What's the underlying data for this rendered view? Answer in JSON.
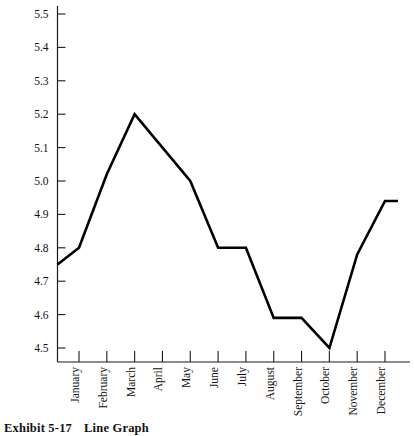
{
  "figure": {
    "caption_label": "Exhibit 5-17",
    "caption_title": "Line Graph"
  },
  "chart_data": {
    "type": "line",
    "title": "",
    "subtitle": "",
    "xlabel": "",
    "ylabel": "",
    "categories": [
      "January",
      "February",
      "March",
      "April",
      "May",
      "June",
      "July",
      "August",
      "September",
      "October",
      "November",
      "December"
    ],
    "values": [
      4.8,
      5.02,
      5.2,
      5.1,
      5.0,
      4.8,
      4.8,
      4.59,
      4.59,
      4.5,
      4.78,
      4.94
    ],
    "series": [
      {
        "name": "series-1",
        "values": [
          4.8,
          5.02,
          5.2,
          5.1,
          5.0,
          4.8,
          4.8,
          4.59,
          4.59,
          4.5,
          4.78,
          4.94
        ]
      }
    ],
    "lead_in_value": 4.75,
    "trail_out_value": 4.94,
    "ylim": [
      4.5,
      5.5
    ],
    "ytick_values": [
      4.5,
      4.6,
      4.7,
      4.8,
      4.9,
      5.0,
      5.1,
      5.2,
      5.3,
      5.4,
      5.5
    ],
    "ytick_labels": [
      "4.5",
      "4.6",
      "4.7",
      "4.8",
      "4.9",
      "5.0",
      "5.1",
      "5.2",
      "5.3",
      "5.4",
      "5.5"
    ],
    "grid": false,
    "legend": false,
    "legend_position": "none",
    "line_color": "#000000",
    "axis_color": "#1a1a1a",
    "background_color": "#ffffff",
    "annotations": []
  }
}
